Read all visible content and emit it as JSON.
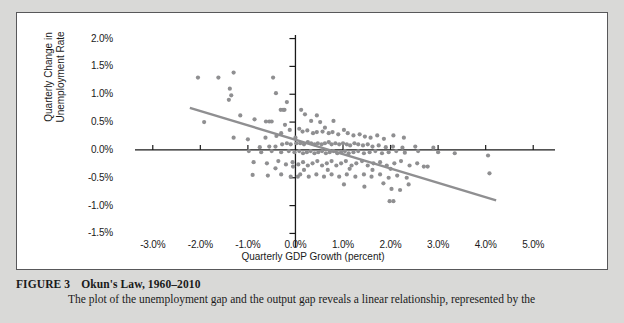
{
  "caption": {
    "figure_number": "FIGURE 3",
    "title": "Okun's Law, 1960–2010",
    "body": "The plot of the unemployment gap and the output gap reveals a linear relationship, represented by the"
  },
  "colors": {
    "page_background": "#d9d9d7",
    "panel_background": "#ffffff",
    "panel_border": "#58585a",
    "axis": "#1a1a1a",
    "point": "#8f8f91",
    "trendline": "#8f8f91",
    "text": "#1a1a1a"
  },
  "chart_data": {
    "type": "scatter",
    "title": "Okun's Law, 1960–2010",
    "xlabel": "Quarterly GDP Growth (percent)",
    "ylabel": "Quarterly Change in Unemployment Rate",
    "xlim": [
      -3.5,
      5.5
    ],
    "ylim": [
      -1.6,
      2.1
    ],
    "grid": false,
    "legend": null,
    "axis_origin": [
      0.0,
      0.0
    ],
    "x_ticks": [
      "-3.0%",
      "-2.0%",
      "-1.0%",
      "0.0%",
      "1.0%",
      "2.0%",
      "3.0%",
      "4.0%",
      "5.0%"
    ],
    "x_tick_values": [
      -3.0,
      -2.0,
      -1.0,
      0.0,
      1.0,
      2.0,
      3.0,
      4.0,
      5.0
    ],
    "y_ticks": [
      "2.0%",
      "1.5%",
      "1.0%",
      "0.5%",
      "0.0%",
      "-0.5%",
      "-1.0%",
      "-1.5%"
    ],
    "y_tick_values": [
      2.0,
      1.5,
      1.0,
      0.5,
      0.0,
      -0.5,
      -1.0,
      -1.5
    ],
    "trendline": {
      "label": "fitted line",
      "x_start": -2.22,
      "y_start": 0.755,
      "x_end": 4.22,
      "y_end": -0.905
    },
    "series": [
      {
        "name": "Quarterly observations 1960–2010",
        "marker": "circle",
        "points": [
          [
            -2.05,
            1.3
          ],
          [
            -1.62,
            1.3
          ],
          [
            -1.3,
            1.39
          ],
          [
            -0.47,
            1.3
          ],
          [
            -1.38,
            1.1
          ],
          [
            -1.35,
            0.98
          ],
          [
            -1.4,
            0.9
          ],
          [
            -0.41,
            1.02
          ],
          [
            -0.18,
            0.86
          ],
          [
            -1.16,
            0.62
          ],
          [
            -1.92,
            0.5
          ],
          [
            -0.86,
            0.55
          ],
          [
            -0.62,
            0.51
          ],
          [
            -0.55,
            0.51
          ],
          [
            -0.5,
            0.51
          ],
          [
            -0.31,
            0.72
          ],
          [
            -0.26,
            0.72
          ],
          [
            -0.23,
            0.72
          ],
          [
            0.12,
            0.72
          ],
          [
            0.2,
            0.64
          ],
          [
            0.45,
            0.62
          ],
          [
            0.33,
            0.52
          ],
          [
            0.52,
            0.5
          ],
          [
            0.8,
            0.52
          ],
          [
            -1.3,
            0.22
          ],
          [
            -1.0,
            0.19
          ],
          [
            -0.63,
            0.22
          ],
          [
            -0.4,
            0.25
          ],
          [
            -0.3,
            0.3
          ],
          [
            -0.12,
            0.36
          ],
          [
            0.08,
            0.38
          ],
          [
            0.15,
            0.33
          ],
          [
            0.25,
            0.35
          ],
          [
            0.37,
            0.3
          ],
          [
            0.45,
            0.32
          ],
          [
            0.57,
            0.33
          ],
          [
            0.62,
            0.4
          ],
          [
            0.7,
            0.3
          ],
          [
            0.78,
            0.32
          ],
          [
            0.9,
            0.28
          ],
          [
            1.02,
            0.36
          ],
          [
            1.1,
            0.3
          ],
          [
            1.22,
            0.26
          ],
          [
            1.35,
            0.28
          ],
          [
            1.46,
            0.24
          ],
          [
            1.58,
            0.22
          ],
          [
            1.72,
            0.26
          ],
          [
            1.86,
            0.2
          ],
          [
            2.06,
            0.26
          ],
          [
            2.28,
            0.22
          ],
          [
            -0.75,
            0.05
          ],
          [
            -0.55,
            0.06
          ],
          [
            -0.42,
            0.06
          ],
          [
            -0.28,
            0.1
          ],
          [
            -0.18,
            0.12
          ],
          [
            -0.1,
            0.1
          ],
          [
            0.02,
            0.12
          ],
          [
            0.1,
            0.12
          ],
          [
            0.18,
            0.1
          ],
          [
            0.26,
            0.14
          ],
          [
            0.33,
            0.12
          ],
          [
            0.4,
            0.1
          ],
          [
            0.47,
            0.12
          ],
          [
            0.55,
            0.1
          ],
          [
            0.62,
            0.12
          ],
          [
            0.7,
            0.14
          ],
          [
            0.76,
            0.1
          ],
          [
            0.84,
            0.12
          ],
          [
            0.92,
            0.1
          ],
          [
            1.0,
            0.12
          ],
          [
            1.08,
            0.1
          ],
          [
            1.15,
            0.08
          ],
          [
            1.24,
            0.12
          ],
          [
            1.32,
            0.1
          ],
          [
            1.42,
            0.08
          ],
          [
            1.52,
            0.1
          ],
          [
            1.62,
            0.06
          ],
          [
            1.75,
            0.08
          ],
          [
            1.9,
            0.05
          ],
          [
            2.05,
            0.06
          ],
          [
            2.25,
            0.04
          ],
          [
            2.52,
            0.06
          ],
          [
            2.9,
            0.04
          ],
          [
            -0.98,
            -0.02
          ],
          [
            -0.72,
            -0.04
          ],
          [
            -0.5,
            -0.02
          ],
          [
            -0.3,
            -0.04
          ],
          [
            -0.14,
            -0.02
          ],
          [
            -0.02,
            -0.04
          ],
          [
            0.08,
            -0.02
          ],
          [
            0.16,
            -0.06
          ],
          [
            0.24,
            -0.04
          ],
          [
            0.32,
            -0.02
          ],
          [
            0.4,
            -0.06
          ],
          [
            0.48,
            -0.04
          ],
          [
            0.56,
            -0.02
          ],
          [
            0.64,
            -0.06
          ],
          [
            0.72,
            -0.04
          ],
          [
            0.8,
            -0.02
          ],
          [
            0.88,
            -0.06
          ],
          [
            0.96,
            -0.04
          ],
          [
            1.04,
            -0.02
          ],
          [
            1.12,
            -0.06
          ],
          [
            1.22,
            -0.04
          ],
          [
            1.32,
            -0.02
          ],
          [
            1.44,
            -0.06
          ],
          [
            1.56,
            -0.04
          ],
          [
            1.68,
            -0.02
          ],
          [
            1.82,
            -0.06
          ],
          [
            1.96,
            -0.04
          ],
          [
            2.12,
            -0.02
          ],
          [
            2.3,
            -0.05
          ],
          [
            2.58,
            -0.02
          ],
          [
            3.0,
            -0.04
          ],
          [
            3.35,
            -0.06
          ],
          [
            4.05,
            -0.1
          ],
          [
            -0.88,
            -0.22
          ],
          [
            -0.6,
            -0.24
          ],
          [
            -0.36,
            -0.2
          ],
          [
            -0.2,
            -0.26
          ],
          [
            -0.06,
            -0.22
          ],
          [
            0.06,
            -0.26
          ],
          [
            0.16,
            -0.22
          ],
          [
            0.26,
            -0.28
          ],
          [
            0.36,
            -0.24
          ],
          [
            0.46,
            -0.2
          ],
          [
            0.56,
            -0.28
          ],
          [
            0.66,
            -0.24
          ],
          [
            0.76,
            -0.2
          ],
          [
            0.86,
            -0.28
          ],
          [
            0.96,
            -0.24
          ],
          [
            1.06,
            -0.2
          ],
          [
            1.18,
            -0.28
          ],
          [
            1.28,
            -0.24
          ],
          [
            1.4,
            -0.2
          ],
          [
            1.52,
            -0.28
          ],
          [
            1.64,
            -0.24
          ],
          [
            1.78,
            -0.22
          ],
          [
            1.92,
            -0.28
          ],
          [
            2.08,
            -0.24
          ],
          [
            2.22,
            -0.2
          ],
          [
            2.4,
            -0.28
          ],
          [
            2.56,
            -0.24
          ],
          [
            2.7,
            -0.3
          ],
          [
            2.78,
            -0.3
          ],
          [
            -0.9,
            -0.45
          ],
          [
            -0.58,
            -0.46
          ],
          [
            -0.3,
            -0.44
          ],
          [
            -0.1,
            -0.48
          ],
          [
            0.1,
            -0.44
          ],
          [
            0.28,
            -0.48
          ],
          [
            0.44,
            -0.44
          ],
          [
            0.6,
            -0.48
          ],
          [
            0.76,
            -0.44
          ],
          [
            0.92,
            -0.48
          ],
          [
            1.08,
            -0.44
          ],
          [
            1.26,
            -0.48
          ],
          [
            1.44,
            -0.44
          ],
          [
            1.6,
            -0.48
          ],
          [
            1.78,
            -0.44
          ],
          [
            1.96,
            -0.5
          ],
          [
            2.14,
            -0.46
          ],
          [
            2.34,
            -0.5
          ],
          [
            4.08,
            -0.42
          ],
          [
            1.02,
            -0.62
          ],
          [
            1.45,
            -0.66
          ],
          [
            1.85,
            -0.6
          ],
          [
            2.02,
            -0.7
          ],
          [
            2.2,
            -0.72
          ],
          [
            2.38,
            -0.62
          ],
          [
            1.98,
            -0.92
          ],
          [
            2.06,
            -0.92
          ],
          [
            -0.42,
            -0.33
          ],
          [
            0.18,
            -0.36
          ],
          [
            0.68,
            -0.36
          ],
          [
            1.14,
            -0.34
          ],
          [
            1.62,
            -0.36
          ],
          [
            2.0,
            -0.34
          ],
          [
            -0.22,
            0.45
          ],
          [
            0.0,
            0.22
          ],
          [
            0.05,
            -0.48
          ],
          [
            -0.05,
            -0.3
          ]
        ]
      }
    ]
  }
}
